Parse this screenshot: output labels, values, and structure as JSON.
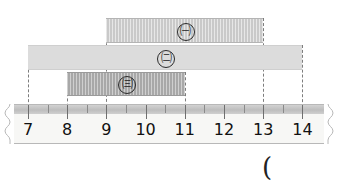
{
  "figure": {
    "type": "interval-comparison-on-ruler",
    "unit_px": 39.2,
    "origin_px": 28,
    "bars": [
      {
        "id": "a",
        "label": "㈠",
        "label_name": "circled-giyeok",
        "start": 9,
        "end": 13,
        "length": 4,
        "fill": "#c9c9c9",
        "hatched": true,
        "top_px": 18,
        "height_px": 25
      },
      {
        "id": "b",
        "label": "㈡",
        "label_name": "circled-nieun",
        "start": 7,
        "end": 14,
        "length": 7,
        "fill": "#dcdcdc",
        "hatched": false,
        "top_px": 45,
        "height_px": 25
      },
      {
        "id": "c",
        "label": "㈢",
        "label_name": "circled-digeut",
        "start": 8,
        "end": 11,
        "length": 3,
        "fill": "#a8a8a8",
        "hatched": true,
        "top_px": 72,
        "height_px": 24
      }
    ],
    "guides": [
      {
        "value": 7,
        "top_px": 45
      },
      {
        "value": 8,
        "top_px": 72
      },
      {
        "value": 9,
        "top_px": 18
      },
      {
        "value": 11,
        "top_px": 72
      },
      {
        "value": 13,
        "top_px": 18
      },
      {
        "value": 14,
        "top_px": 45
      }
    ],
    "guide_bottom_px": 112
  },
  "ruler": {
    "name": "ruler-number-line",
    "numbers": [
      7,
      8,
      9,
      10,
      11,
      12,
      13,
      14
    ],
    "min": 7,
    "max": 14,
    "minor_ticks_per_unit": 2,
    "torn_edges": true
  },
  "annotation": {
    "paren": "("
  },
  "colors": {
    "bar_a": "#c9c9c9",
    "bar_b": "#dcdcdc",
    "bar_c": "#a8a8a8",
    "ruler_band": "#c4c4c4",
    "ruler_body": "#f7f7f5",
    "guide_line": "#7d7d7d",
    "text": "#111111"
  }
}
